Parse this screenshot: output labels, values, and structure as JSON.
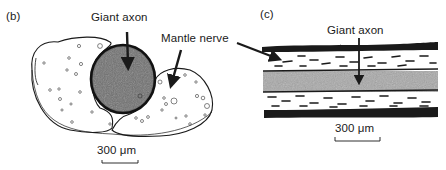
{
  "panels": [
    {
      "id": "b",
      "label": "(b)",
      "view": "transverse section",
      "annotations": [
        {
          "text": "Giant axon",
          "points_to": "dark circular axon"
        },
        {
          "text": "Mantle nerve",
          "points_to": "surrounding nerve bundle"
        }
      ],
      "scale_bar": "300 μm"
    },
    {
      "id": "c",
      "label": "(c)",
      "view": "longitudinal section",
      "annotations": [
        {
          "text": "Giant axon",
          "points_to": "central grey band"
        }
      ],
      "scale_bar": "300 μm"
    }
  ],
  "colors": {
    "ink": "#1a1a1a",
    "axon_fill": "#6e6e6e",
    "axon_band": "#a8a8a8",
    "background": "#ffffff"
  }
}
